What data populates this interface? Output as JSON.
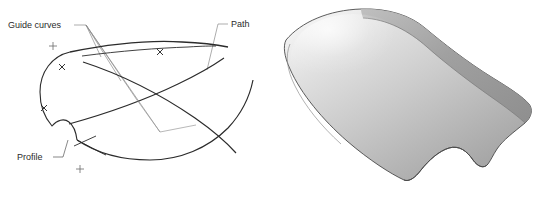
{
  "figure": {
    "background_color": "#ffffff",
    "width": 542,
    "height": 197
  },
  "wireframe": {
    "panel_name": "wireframe-diagram",
    "line_color": "#2b2b2b",
    "leader_color": "#8a8a8a",
    "labels": [
      {
        "id": "guide-curves",
        "text": "Guide curves",
        "x": 8,
        "y": 26
      },
      {
        "id": "path",
        "text": "Path",
        "x": 230,
        "y": 27
      },
      {
        "id": "profile",
        "text": "Profile",
        "x": 18,
        "y": 157
      }
    ],
    "markers": {
      "plus": [
        {
          "x": 53,
          "y": 46
        },
        {
          "x": 80,
          "y": 169
        }
      ],
      "cross": [
        {
          "x": 62,
          "y": 67
        },
        {
          "x": 44,
          "y": 108
        },
        {
          "x": 160,
          "y": 52
        }
      ]
    }
  },
  "render": {
    "panel_name": "shaded-3d-surface",
    "surface_light": "#f2f2f2",
    "surface_mid": "#c8c8c8",
    "surface_dark": "#8f8f8f",
    "crease_color": "#9a9a9a",
    "outline_color": "#4a4a4a"
  }
}
